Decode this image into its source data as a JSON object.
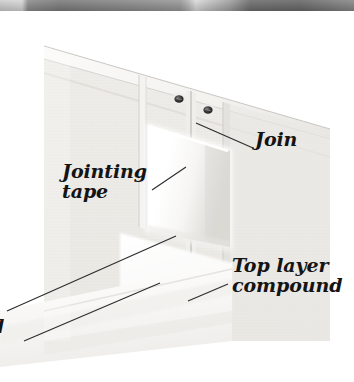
{
  "figure": {
    "kind": "photographic-diagram",
    "background_color": "#ffffff",
    "frame_color": "#8c8c8c"
  },
  "top_strip": {
    "description": "cropped bottom edge of the image above",
    "color_dark": "#7d7d7d",
    "color_light": "#d8d8d8"
  },
  "scene": {
    "wall_face_color": "#eceae6",
    "wall_top_color": "#f7f6f4",
    "tape_color": "#ffffff",
    "floor_color": "#f4f3f1",
    "screw_color": "#3a3a3a",
    "outline_color": "#b9b7b3"
  },
  "labels": [
    {
      "id": "join",
      "text": "Join",
      "lines": [
        "Join"
      ]
    },
    {
      "id": "tape",
      "text": "Jointing\ntape",
      "lines": [
        "Jointing",
        "tape"
      ]
    },
    {
      "id": "top_layer",
      "text": "Top layer\ncompound",
      "lines": [
        "Top layer",
        "compound"
      ]
    },
    {
      "id": "partial",
      "text": "d",
      "lines": [
        "d"
      ]
    }
  ],
  "label_text": {
    "join": "Join",
    "jointing_tape": "Jointing\ntape",
    "top_layer_compound": "Top layer\ncompound",
    "partial_clipped": "d"
  },
  "leader_lines": {
    "count": 4,
    "color": "#2d2d2d"
  }
}
